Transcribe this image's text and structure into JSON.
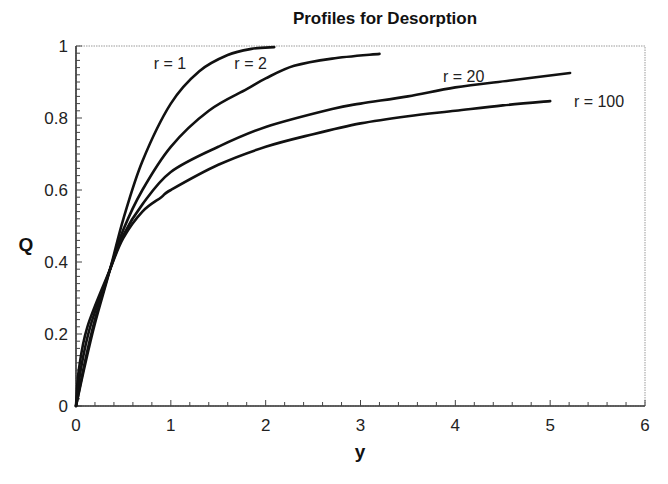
{
  "chart_data": {
    "type": "line",
    "title": "Profiles for Desorption",
    "xlabel": "y",
    "ylabel": "Q",
    "xlim": [
      0,
      6
    ],
    "ylim": [
      0,
      1
    ],
    "xticks": [
      0,
      1,
      2,
      3,
      4,
      5,
      6
    ],
    "yticks": [
      0,
      0.2,
      0.4,
      0.6,
      0.8,
      1
    ],
    "xtick_labels": [
      "0",
      "1",
      "2",
      "3",
      "4",
      "5",
      "6"
    ],
    "ytick_labels": [
      "0",
      "0.2",
      "0.4",
      "0.6",
      "0.8",
      "1"
    ],
    "grid": false,
    "legend": "inline labels",
    "series": [
      {
        "name": "r = 1",
        "label_pos": [
          0.82,
          0.935
        ],
        "x": [
          0,
          0.1,
          0.2,
          0.36,
          0.5,
          0.7,
          1.0,
          1.3,
          1.6,
          1.85,
          2.09
        ],
        "y": [
          0,
          0.12,
          0.23,
          0.38,
          0.52,
          0.68,
          0.84,
          0.93,
          0.975,
          0.992,
          0.997
        ]
      },
      {
        "name": "r = 2",
        "label_pos": [
          1.67,
          0.935
        ],
        "x": [
          0,
          0.1,
          0.2,
          0.36,
          0.5,
          0.7,
          1.0,
          1.4,
          1.8,
          2.0,
          2.3,
          2.7,
          3.2
        ],
        "y": [
          0,
          0.13,
          0.24,
          0.38,
          0.49,
          0.6,
          0.72,
          0.82,
          0.88,
          0.91,
          0.945,
          0.965,
          0.978
        ]
      },
      {
        "name": "r = 20",
        "label_pos": [
          3.87,
          0.9
        ],
        "x": [
          0,
          0.05,
          0.15,
          0.36,
          0.5,
          0.7,
          1.0,
          1.5,
          2.0,
          2.7,
          3.0,
          3.5,
          4.0,
          4.6,
          5.21
        ],
        "y": [
          0,
          0.1,
          0.22,
          0.38,
          0.475,
          0.56,
          0.65,
          0.72,
          0.775,
          0.825,
          0.84,
          0.86,
          0.885,
          0.905,
          0.925
        ]
      },
      {
        "name": "r = 100",
        "label_pos": [
          5.25,
          0.83
        ],
        "x": [
          0,
          0.03,
          0.12,
          0.36,
          0.5,
          0.7,
          0.9,
          1.0,
          1.5,
          2.0,
          2.5,
          3.0,
          3.5,
          4.0,
          4.5,
          5.0
        ],
        "y": [
          0,
          0.1,
          0.22,
          0.38,
          0.467,
          0.54,
          0.58,
          0.6,
          0.67,
          0.72,
          0.755,
          0.785,
          0.805,
          0.82,
          0.835,
          0.847
        ]
      }
    ]
  }
}
